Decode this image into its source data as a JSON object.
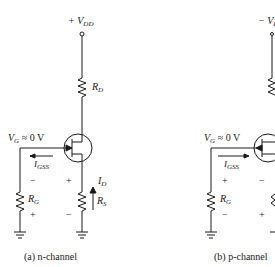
{
  "circuits": [
    {
      "id": "a",
      "caption": "(a) n-channel",
      "supply": {
        "sign": "+",
        "symbol": "V",
        "subscript": "DD"
      },
      "drain_resistor": {
        "symbol": "R",
        "subscript": "D"
      },
      "gate_voltage": {
        "symbol": "V",
        "subscript": "G",
        "relation": "≈ 0 V"
      },
      "gate_current": {
        "symbol": "I",
        "subscript": "GSS",
        "direction": "left"
      },
      "gate_resistor": {
        "symbol": "R",
        "subscript": "G",
        "top_polarity": "−",
        "bottom_polarity": "+"
      },
      "source_resistor": {
        "symbol": "R",
        "subscript": "S",
        "top_polarity": "+",
        "bottom_polarity": "−"
      },
      "drain_current": {
        "symbol": "I",
        "subscript": "D",
        "direction": "up"
      },
      "transistor": "n-channel JFET"
    },
    {
      "id": "b",
      "caption": "(b) p-channel",
      "supply": {
        "sign": "−",
        "symbol": "V",
        "subscript": "DD"
      },
      "gate_voltage": {
        "symbol": "V",
        "subscript": "G",
        "relation": "≈ 0 V"
      },
      "gate_current": {
        "symbol": "I",
        "subscript": "GSS",
        "direction": "right"
      },
      "gate_resistor": {
        "symbol": "R",
        "subscript": "G",
        "top_polarity": "+",
        "bottom_polarity": "−"
      },
      "source_resistor_polarity": {
        "top": "−",
        "bottom": "+"
      },
      "transistor": "p-channel JFET"
    }
  ],
  "colors": {
    "ink": "#1a1a1a",
    "background": "#ffffff"
  }
}
